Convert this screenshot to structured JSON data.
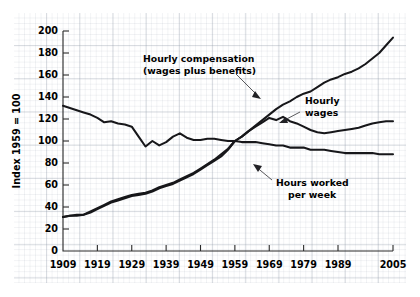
{
  "chart_data": {
    "type": "line",
    "title": "",
    "xlabel": "",
    "ylabel": "Index 1959 = 100",
    "xlim": [
      1909,
      2005
    ],
    "ylim": [
      0,
      200
    ],
    "grid": true,
    "legend_position": "inline-annotations",
    "x_tick_labels": [
      "1909",
      "1919",
      "1929",
      "1939",
      "1949",
      "1959",
      "1969",
      "1979",
      "1989",
      "2005"
    ],
    "x_tick_values": [
      1909,
      1919,
      1929,
      1939,
      1949,
      1959,
      1969,
      1979,
      1989,
      2005
    ],
    "y_tick_labels": [
      "0",
      "20",
      "40",
      "60",
      "80",
      "100",
      "120",
      "140",
      "160",
      "180",
      "200"
    ],
    "y_tick_values": [
      0,
      20,
      40,
      60,
      80,
      100,
      120,
      140,
      160,
      180,
      200
    ],
    "annotations": [
      {
        "name": "hourly-compensation-label",
        "line1": "Hourly compensation",
        "line2": "(wages plus benefits)"
      },
      {
        "name": "hourly-wages-label",
        "line1": "Hourly",
        "line2": "wages"
      },
      {
        "name": "hours-worked-label",
        "line1": "Hours worked",
        "line2": "per week"
      }
    ],
    "series": [
      {
        "name": "Hourly compensation (wages plus benefits)",
        "color": "#17171a",
        "x": [
          1909,
          1911,
          1913,
          1915,
          1917,
          1919,
          1921,
          1923,
          1925,
          1927,
          1929,
          1931,
          1933,
          1935,
          1937,
          1939,
          1941,
          1943,
          1945,
          1947,
          1949,
          1951,
          1953,
          1955,
          1957,
          1959,
          1961,
          1963,
          1965,
          1967,
          1969,
          1971,
          1973,
          1975,
          1977,
          1979,
          1981,
          1983,
          1985,
          1987,
          1989,
          1991,
          1993,
          1995,
          1997,
          1999,
          2001,
          2003,
          2005
        ],
        "values": [
          31,
          32,
          32,
          33,
          35,
          38,
          41,
          44,
          46,
          48,
          50,
          51,
          52,
          54,
          57,
          59,
          61,
          64,
          67,
          70,
          74,
          78,
          82,
          86,
          92,
          100,
          104,
          109,
          114,
          119,
          124,
          129,
          133,
          136,
          140,
          143,
          145,
          149,
          153,
          156,
          158,
          161,
          163,
          166,
          170,
          175,
          180,
          187,
          194
        ]
      },
      {
        "name": "Hourly wages",
        "color": "#17171a",
        "x": [
          1909,
          1911,
          1913,
          1915,
          1917,
          1919,
          1921,
          1923,
          1925,
          1927,
          1929,
          1931,
          1933,
          1935,
          1937,
          1939,
          1941,
          1943,
          1945,
          1947,
          1949,
          1951,
          1953,
          1955,
          1957,
          1959,
          1961,
          1963,
          1965,
          1967,
          1969,
          1971,
          1973,
          1975,
          1977,
          1979,
          1981,
          1983,
          1985,
          1987,
          1989,
          1991,
          1993,
          1995,
          1997,
          1999,
          2001,
          2003,
          2005
        ],
        "values": [
          31,
          32,
          33,
          33,
          36,
          39,
          42,
          45,
          47,
          49,
          51,
          52,
          53,
          55,
          58,
          60,
          62,
          65,
          68,
          71,
          75,
          79,
          83,
          88,
          93,
          100,
          104,
          109,
          113,
          117,
          121,
          119,
          122,
          118,
          116,
          113,
          110,
          108,
          107,
          108,
          109,
          110,
          111,
          112,
          114,
          116,
          117,
          118,
          118
        ]
      },
      {
        "name": "Hours worked per week",
        "color": "#17171a",
        "x": [
          1909,
          1911,
          1913,
          1915,
          1917,
          1919,
          1921,
          1923,
          1925,
          1927,
          1929,
          1931,
          1933,
          1935,
          1937,
          1939,
          1941,
          1943,
          1945,
          1947,
          1949,
          1951,
          1953,
          1955,
          1957,
          1959,
          1961,
          1963,
          1965,
          1967,
          1969,
          1971,
          1973,
          1975,
          1977,
          1979,
          1981,
          1983,
          1985,
          1987,
          1989,
          1991,
          1993,
          1995,
          1997,
          1999,
          2001,
          2003,
          2005
        ],
        "values": [
          132,
          130,
          128,
          126,
          124,
          121,
          117,
          118,
          116,
          115,
          113,
          104,
          95,
          100,
          96,
          99,
          104,
          107,
          103,
          101,
          101,
          102,
          102,
          101,
          100,
          100,
          99,
          99,
          99,
          98,
          97,
          96,
          96,
          94,
          94,
          94,
          92,
          92,
          92,
          91,
          90,
          89,
          89,
          89,
          89,
          89,
          88,
          88,
          88
        ]
      }
    ]
  }
}
